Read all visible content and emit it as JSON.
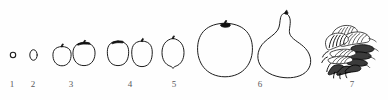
{
  "figure": {
    "kind": "line-drawing-plate",
    "caption_style": "numbered-stages",
    "background_color": "#fefefe",
    "ink_color": "#1c1c1c",
    "label_color": "#59595b",
    "width": 388,
    "height": 100,
    "stages": [
      {
        "number": "1",
        "label_x": 12,
        "label_y": 84,
        "description": "tiny dot ovary",
        "specimens": [
          {
            "shape": "dot",
            "cx": 13,
            "cy": 55,
            "rx": 2.6,
            "ry": 2.6,
            "stem": false
          }
        ]
      },
      {
        "number": "2",
        "label_x": 33,
        "label_y": 84,
        "description": "small narrow oval",
        "specimens": [
          {
            "shape": "oval",
            "cx": 33,
            "cy": 55,
            "rx": 3.6,
            "ry": 5.2,
            "stem": false
          }
        ]
      },
      {
        "number": "3",
        "label_x": 71,
        "label_y": 84,
        "description": "two small round fruits with stems",
        "specimens": [
          {
            "shape": "round",
            "cx": 62,
            "cy": 56,
            "rx": 9,
            "ry": 9.5,
            "stem": true,
            "stem_size": "small"
          },
          {
            "shape": "round",
            "cx": 84,
            "cy": 54,
            "rx": 11,
            "ry": 11.5,
            "stem": true,
            "stem_size": "large"
          }
        ]
      },
      {
        "number": "4",
        "label_x": 130,
        "label_y": 84,
        "description": "two egg shaped fruits",
        "specimens": [
          {
            "shape": "egg",
            "cx": 118,
            "cy": 53,
            "rx": 10.5,
            "ry": 12,
            "stem": true,
            "stem_size": "large"
          },
          {
            "shape": "egg",
            "cx": 142,
            "cy": 54,
            "rx": 10,
            "ry": 12.5,
            "stem": true,
            "stem_size": "small"
          }
        ]
      },
      {
        "number": "5",
        "label_x": 174,
        "label_y": 84,
        "description": "lemon shaped fruit with pointed base",
        "specimens": [
          {
            "shape": "lemon",
            "cx": 173,
            "cy": 52,
            "rx": 11,
            "ry": 14,
            "stem": true,
            "stem_size": "small"
          }
        ]
      },
      {
        "number": "6",
        "label_x": 260,
        "label_y": 84,
        "description": "large round fruit and large pear shaped fruit",
        "specimens": [
          {
            "shape": "round-large",
            "cx": 225,
            "cy": 50,
            "rx": 27,
            "ry": 27,
            "stem": true,
            "stem_size": "large"
          },
          {
            "shape": "pear",
            "cx": 284,
            "cy": 45,
            "rx": 26,
            "ry": 33,
            "stem": true,
            "stem_size": "small"
          }
        ]
      },
      {
        "number": "7",
        "label_x": 352,
        "label_y": 84,
        "description": "fibrous dissected cluster of hatched pointed lobes",
        "specimens": [
          {
            "shape": "fibrous-cluster",
            "cx": 352,
            "cy": 48,
            "rx": 30,
            "ry": 32,
            "stem": false
          }
        ]
      }
    ]
  }
}
